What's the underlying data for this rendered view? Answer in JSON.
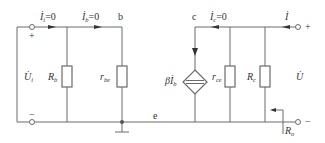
{
  "figure": {
    "type": "small-signal equivalent circuit (output resistance test)",
    "nodes": {
      "b": "b",
      "c": "c",
      "e": "e"
    },
    "labels": {
      "ii": {
        "main": "İ",
        "sub": "i",
        "eq": "=0"
      },
      "ib": {
        "main": "İ",
        "sub": "b",
        "eq": "=0"
      },
      "ic": {
        "main": "İ",
        "sub": "c",
        "eq": "=0"
      },
      "i_test": {
        "main": "İ"
      },
      "ui": {
        "main": "U̇",
        "sub": "i"
      },
      "u_test": {
        "main": "U̇"
      },
      "rb": {
        "main": "R",
        "sub": "b"
      },
      "rbe": {
        "main": "r",
        "sub": "be"
      },
      "beta_ib": {
        "main": "βİ",
        "sub": "b"
      },
      "rce": {
        "main": "r",
        "sub": "ce"
      },
      "rc": {
        "main": "R",
        "sub": "c"
      },
      "ro": {
        "main": "R",
        "sub": "o"
      },
      "plus_left": "+",
      "minus_left": "−",
      "plus_right": "+",
      "minus_right": "−"
    },
    "colors": {
      "line": "#6a6a6a",
      "text": "#333333"
    }
  }
}
